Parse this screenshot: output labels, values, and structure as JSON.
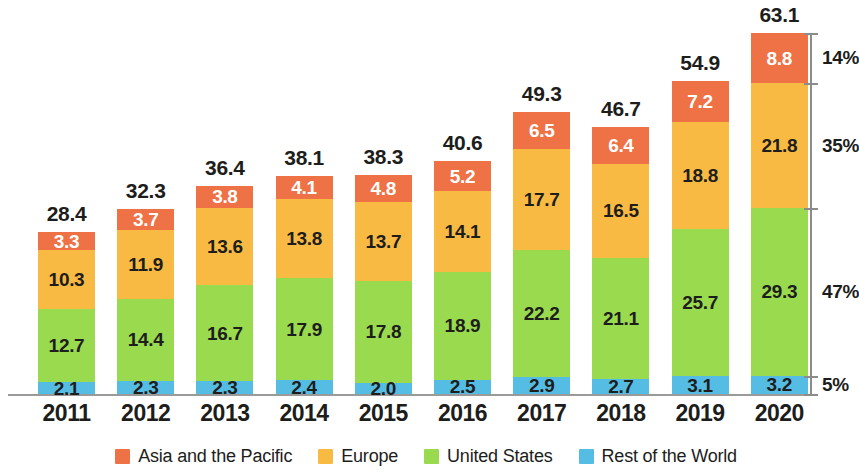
{
  "chart_data": {
    "type": "bar",
    "stacked": true,
    "title": "",
    "subtitle": "",
    "xlabel": "",
    "ylabel": "",
    "grid": false,
    "legend_position": "bottom",
    "categories": [
      "2011",
      "2012",
      "2013",
      "2014",
      "2015",
      "2016",
      "2017",
      "2018",
      "2019",
      "2020"
    ],
    "series": [
      {
        "name": "Rest of the World",
        "color": "#55bde4",
        "values": [
          2.1,
          2.3,
          2.3,
          2.4,
          2.0,
          2.5,
          2.9,
          2.7,
          3.1,
          3.2
        ]
      },
      {
        "name": "United States",
        "color": "#9ada4f",
        "values": [
          12.7,
          14.4,
          16.7,
          17.9,
          17.8,
          18.9,
          22.2,
          21.1,
          25.7,
          29.3
        ]
      },
      {
        "name": "Europe",
        "color": "#f9ba44",
        "values": [
          10.3,
          11.9,
          13.6,
          13.8,
          13.7,
          14.1,
          17.7,
          16.5,
          18.8,
          21.8
        ]
      },
      {
        "name": "Asia and the Pacific",
        "color": "#ef7146",
        "values": [
          3.3,
          3.7,
          3.8,
          4.1,
          4.8,
          5.2,
          6.5,
          6.4,
          7.2,
          8.8
        ]
      }
    ],
    "totals": [
      28.4,
      32.3,
      36.4,
      38.1,
      38.3,
      40.6,
      49.3,
      46.7,
      54.9,
      63.1
    ],
    "ylim": [
      0,
      63.1
    ],
    "secondary_axis": {
      "position": "right",
      "ticks": [
        "14%",
        "35%",
        "47%",
        "5%"
      ],
      "description": "2020 share by region"
    }
  },
  "legend": {
    "items": [
      {
        "label": "Asia and the Pacific",
        "color": "#ef7146"
      },
      {
        "label": "Europe",
        "color": "#f9ba44"
      },
      {
        "label": "United States",
        "color": "#9ada4f"
      },
      {
        "label": "Rest of the World",
        "color": "#55bde4"
      }
    ]
  }
}
